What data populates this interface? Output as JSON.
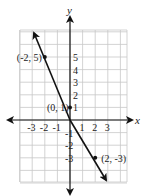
{
  "chart_data": {
    "type": "line",
    "title": "",
    "xlabel": "x",
    "ylabel": "y",
    "xlim": [
      -4,
      4.5
    ],
    "ylim": [
      -5,
      7
    ],
    "grid": true,
    "x_ticks": [
      -3,
      -2,
      -1,
      1,
      2,
      3
    ],
    "y_ticks": [
      5,
      4,
      3,
      2,
      1,
      -1,
      -2,
      -3
    ],
    "series": [
      {
        "name": "y = -2x + 1",
        "x": [
          -2,
          0,
          2
        ],
        "y": [
          5,
          1,
          -3
        ],
        "line_extends": true
      }
    ],
    "annotations": [
      {
        "text": "(-2, 5)",
        "x": -2,
        "y": 5
      },
      {
        "text": "(0, 1)",
        "x": 0,
        "y": 1
      },
      {
        "text": "(2, -3)",
        "x": 2,
        "y": -3
      }
    ]
  },
  "labels": {
    "x_axis": "x",
    "y_axis": "y",
    "x_ticks": [
      "-3",
      "-2",
      "-1",
      "1",
      "2",
      "3"
    ],
    "y_ticks": [
      "5",
      "4",
      "3",
      "2",
      "1",
      "-1",
      "-2",
      "-3"
    ],
    "points": [
      "(-2, 5)",
      "(0, 1)",
      "(2, -3)"
    ]
  },
  "colors": {
    "grid": "#c8c8c8",
    "axis": "#111111",
    "line": "#111111"
  }
}
